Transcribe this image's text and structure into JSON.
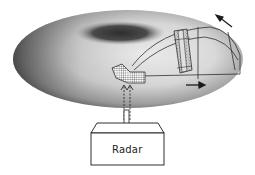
{
  "diagram": {
    "type": "radar illumination of a toroidal plasma / vessel",
    "components": [
      {
        "id": "torus",
        "description": "elliptical shaded toroidal vessel"
      },
      {
        "id": "antenna",
        "description": "gridded phased-array antenna inside the vessel"
      },
      {
        "id": "beam",
        "description": "beam lines from antenna spreading across the vessel"
      },
      {
        "id": "scattering-volume",
        "description": "stippled rectangular banded region intersected by beam"
      },
      {
        "id": "feed",
        "description": "waveguide feed with dashed upward arrows from radar box"
      },
      {
        "id": "radar-box",
        "description": "3D box labeled Radar"
      },
      {
        "id": "direction-arrow-top",
        "description": "arrow pointing up-left near top right"
      },
      {
        "id": "direction-arrow-right",
        "description": "arrow pointing right below scattering volume"
      }
    ]
  },
  "labels": {
    "radar": "Radar"
  },
  "colors": {
    "background": "#ffffff",
    "torus_light": "#e6e6e6",
    "torus_dark": "#3a3a3a",
    "line": "#1a1a1a"
  }
}
